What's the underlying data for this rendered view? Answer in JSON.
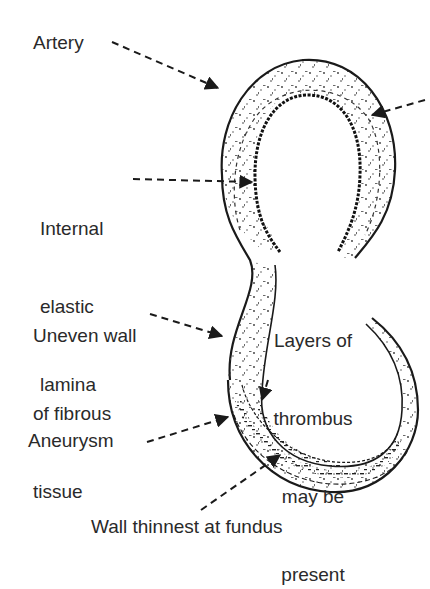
{
  "diagram": {
    "labels": {
      "artery": "Artery",
      "internal_elastic_lamina": [
        "Internal",
        "elastic",
        "lamina"
      ],
      "uneven_wall": [
        "Uneven wall",
        "of fibrous",
        "tissue"
      ],
      "thrombus": [
        "Layers of",
        "thrombus",
        "may be",
        "present"
      ],
      "aneurysm": "Aneurysm",
      "wall_thinnest": "Wall thinnest at fundus"
    },
    "colors": {
      "ink": "#1a1a1a",
      "text": "#2a2a2a",
      "background": "#ffffff"
    }
  }
}
